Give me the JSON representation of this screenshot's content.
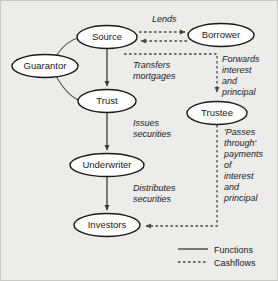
{
  "diagram": {
    "background_color": "#ececeb",
    "node_fill": "#ffffff",
    "stroke_color": "#1a1a1a",
    "nodes": [
      {
        "id": "source",
        "label": "Source",
        "cx": 107,
        "cy": 37,
        "rx": 30,
        "ry": 11.5
      },
      {
        "id": "borrower",
        "label": "Borrower",
        "cx": 221,
        "cy": 35,
        "rx": 33,
        "ry": 11.5
      },
      {
        "id": "guarantor",
        "label": "Guarantor",
        "cx": 45,
        "cy": 66,
        "rx": 33,
        "ry": 11.5
      },
      {
        "id": "trust",
        "label": "Trust",
        "cx": 107,
        "cy": 101,
        "rx": 29,
        "ry": 11.5
      },
      {
        "id": "trustee",
        "label": "Trustee",
        "cx": 217,
        "cy": 113,
        "rx": 30,
        "ry": 11.5
      },
      {
        "id": "underwriter",
        "label": "Underwriter",
        "cx": 107,
        "cy": 165,
        "rx": 37,
        "ry": 11.5
      },
      {
        "id": "investors",
        "label": "Investors",
        "cx": 107,
        "cy": 225,
        "rx": 33,
        "ry": 11.5
      }
    ],
    "edge_labels": [
      {
        "id": "lends",
        "lines": [
          "Lends"
        ],
        "x": 152,
        "y": 22
      },
      {
        "id": "transfers",
        "lines": [
          "Transfers",
          "mortgages"
        ],
        "x": 133,
        "y": 68
      },
      {
        "id": "forwards",
        "lines": [
          "Forwards",
          "interest",
          "and",
          "principal"
        ],
        "x": 222,
        "y": 62
      },
      {
        "id": "issues",
        "lines": [
          "Issues",
          "securities"
        ],
        "x": 133,
        "y": 126
      },
      {
        "id": "passes-through",
        "lines": [
          "'Passes",
          "through'",
          "payments",
          "of",
          "interest",
          "and",
          "principal"
        ],
        "x": 224,
        "y": 135
      },
      {
        "id": "distributes",
        "lines": [
          "Distributes",
          "securities"
        ],
        "x": 133,
        "y": 191
      }
    ],
    "legend": {
      "items": [
        {
          "id": "functions",
          "label": "Functions",
          "style": "solid"
        },
        {
          "id": "cashflows",
          "label": "Cashflows",
          "style": "dashed"
        }
      ]
    }
  }
}
